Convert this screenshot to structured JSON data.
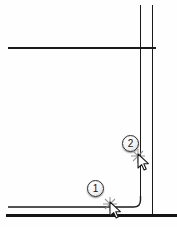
{
  "drawing": {
    "title": "cad-snap-sequence",
    "background_color": "#fefefe",
    "line_color": "#1a1a1a",
    "callouts": [
      {
        "id": "1",
        "label": "1",
        "x": 87,
        "y": 180
      },
      {
        "id": "2",
        "label": "2",
        "x": 122,
        "y": 135
      }
    ],
    "cursors": [
      {
        "id": "cursor-1",
        "type": "arrow-with-snap-marker",
        "x": 103,
        "y": 197
      },
      {
        "id": "cursor-2",
        "type": "arrow-with-snap-marker",
        "x": 131,
        "y": 149
      }
    ],
    "geometry": {
      "horizontal_top": {
        "x1": 8,
        "y1": 48,
        "x2": 156,
        "y2": 48,
        "width": 1.6
      },
      "vertical_inner": {
        "x1": 140.5,
        "y1": 5,
        "x2": 140.5,
        "y2": 207,
        "width": 1.7
      },
      "vertical_outer": {
        "x1": 152.5,
        "y1": 5,
        "x2": 152.5,
        "y2": 215,
        "width": 1.7
      },
      "horizontal_thin_bottom": {
        "x1": 8,
        "y1": 207,
        "x2": 133,
        "y2": 207,
        "width": 1.4
      },
      "corner_radius": 7,
      "horizontal_thick_bottom": {
        "x1": 6,
        "y1": 215,
        "x2": 177,
        "y2": 215,
        "width": 3.2
      }
    }
  }
}
